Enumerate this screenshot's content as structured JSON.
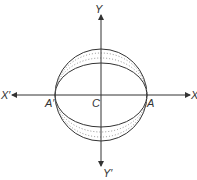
{
  "diagram": {
    "labels": {
      "y_axis_top": "Y",
      "y_axis_bottom": "Y′",
      "x_axis_left": "X′",
      "x_axis_right": "X",
      "center": "C",
      "point_right": "A",
      "point_left": "A′"
    },
    "colors": {
      "stroke": "#333333",
      "dotted": "#777777",
      "background": "#ffffff"
    },
    "geometry": {
      "center": [
        101,
        95
      ],
      "radius": 46,
      "inner_ellipse_ry": 32,
      "dotted_ellipse_ry": [
        37,
        42
      ]
    }
  }
}
